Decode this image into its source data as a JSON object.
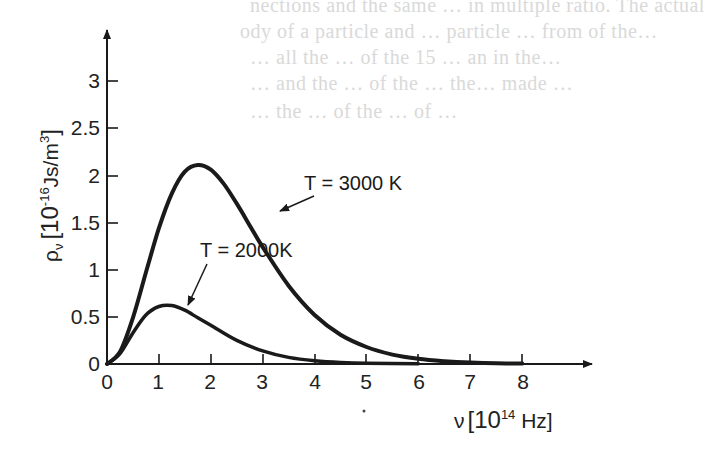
{
  "background_text": [
    "nections and the same … in multiple ratio. The actual",
    "ody of a particle and … particle … from of the…",
    "… all the … of the 15 … an in the…",
    "… and the … of the … the… made …",
    "… the … of the … of …",
    "… the …"
  ],
  "chart_data": {
    "type": "line",
    "title": "",
    "xlabel": "ν [10^14 Hz]",
    "ylabel": "ρ_ν [10^-16 Js/m^3]",
    "x_ticks": [
      0,
      1,
      2,
      3,
      4,
      5,
      6,
      7,
      8
    ],
    "y_ticks": [
      0,
      0.5,
      1,
      1.5,
      2,
      2.5,
      3
    ],
    "y_tick_labels": [
      "0",
      "0.5",
      "1",
      "1.5",
      "2",
      "2.5",
      "3"
    ],
    "xlim": [
      0,
      9.3
    ],
    "ylim": [
      0,
      3.3
    ],
    "grid": false,
    "legend": "none (inline annotations with arrows)",
    "series": [
      {
        "name": "T = 3000K",
        "x": [
          0,
          0.25,
          0.5,
          0.75,
          1.0,
          1.25,
          1.5,
          1.75,
          2.0,
          2.25,
          2.5,
          2.75,
          3.0,
          3.5,
          4.0,
          4.5,
          5.0,
          5.5,
          6.0,
          6.5,
          7.0,
          7.5,
          8.0
        ],
        "values": [
          0,
          0.13,
          0.49,
          0.97,
          1.44,
          1.81,
          2.04,
          2.11,
          2.06,
          1.91,
          1.7,
          1.47,
          1.24,
          0.83,
          0.52,
          0.31,
          0.18,
          0.1,
          0.055,
          0.029,
          0.015,
          0.008,
          0.004
        ],
        "peak": {
          "x": 1.76,
          "y": 2.11
        }
      },
      {
        "name": "T = 2000K",
        "x": [
          0,
          0.25,
          0.5,
          0.75,
          1.0,
          1.25,
          1.5,
          1.75,
          2.0,
          2.5,
          3.0,
          3.5,
          4.0,
          4.5,
          5.0,
          6.0
        ],
        "values": [
          0,
          0.11,
          0.33,
          0.52,
          0.61,
          0.62,
          0.57,
          0.49,
          0.41,
          0.25,
          0.14,
          0.07,
          0.035,
          0.017,
          0.008,
          0.002
        ],
        "peak": {
          "x": 1.18,
          "y": 0.63
        }
      }
    ],
    "annotations": [
      {
        "text": "T = 3000K",
        "points_to": "T = 3000K curve, descending side near ν≈2.6"
      },
      {
        "text": "T = 2000K",
        "points_to": "T = 2000K curve, near peak ν≈1.3"
      }
    ]
  },
  "labels": {
    "y_axis_symbol": "ρ",
    "y_axis_sub": "ν",
    "y_axis_unit_open": "[10",
    "y_axis_unit_exp": "-16",
    "y_axis_unit_rest": "Js/m",
    "y_axis_unit_exp2": "3",
    "y_axis_unit_close": "]",
    "x_axis_symbol": "ν",
    "x_axis_unit_open": "[10",
    "x_axis_unit_exp": "14",
    "x_axis_unit_rest": " Hz]",
    "ann_3000": "T = 3000 K",
    "ann_2000": "T = 2000K",
    "x_tick_0": "0",
    "x_tick_1": "1",
    "x_tick_2": "2",
    "x_tick_3": "3",
    "x_tick_4": "4",
    "x_tick_5": "5",
    "x_tick_6": "6",
    "x_tick_7": "7",
    "x_tick_8": "8",
    "y_tick_0": "0",
    "y_tick_05": "0.5",
    "y_tick_1": "1",
    "y_tick_15": "1.5",
    "y_tick_2": "2",
    "y_tick_25": "2.5",
    "y_tick_3": "3"
  }
}
